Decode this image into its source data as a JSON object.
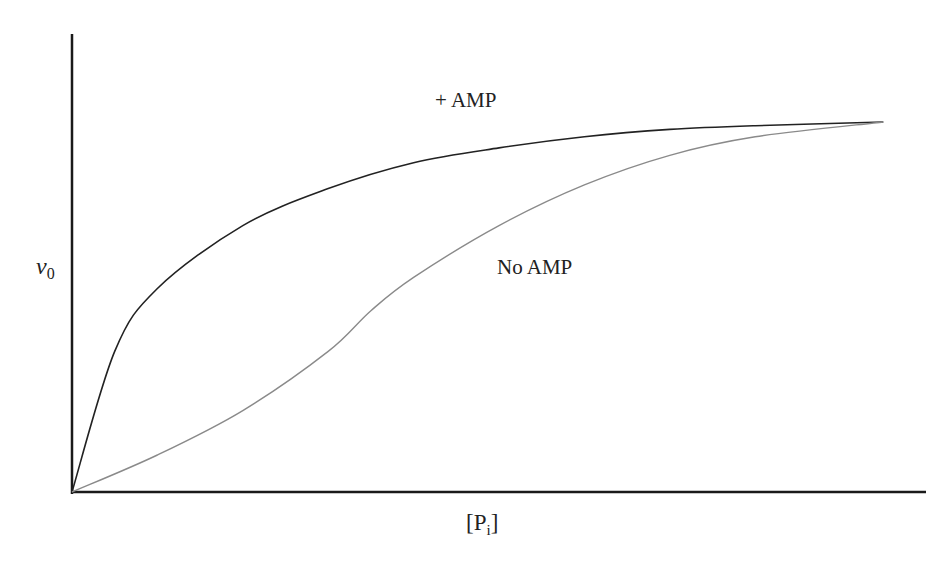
{
  "chart_data": {
    "type": "line",
    "title": "",
    "xlabel": "[Pi]",
    "xlabel_main": "P",
    "xlabel_sub": "i",
    "ylabel": "v0",
    "ylabel_main": "v",
    "ylabel_sub": "0",
    "xlim": [
      0,
      1
    ],
    "ylim": [
      0,
      1
    ],
    "ticks": "none",
    "grid": false,
    "legend": "inline curve labels",
    "series": [
      {
        "name": "+ AMP",
        "shape": "hyperbolic (Michaelis-Menten-like)",
        "color": "#222222",
        "x": [
          0,
          0.05,
          0.1,
          0.2,
          0.3,
          0.4,
          0.5,
          0.6,
          0.7,
          0.8,
          0.95
        ],
        "values": [
          0,
          0.38,
          0.55,
          0.72,
          0.82,
          0.89,
          0.93,
          0.96,
          0.98,
          0.99,
          1.0
        ]
      },
      {
        "name": "No AMP",
        "shape": "sigmoidal (cooperative)",
        "color": "#8a8a8a",
        "x": [
          0,
          0.1,
          0.2,
          0.3,
          0.35,
          0.4,
          0.5,
          0.6,
          0.7,
          0.8,
          0.95
        ],
        "values": [
          0,
          0.1,
          0.22,
          0.38,
          0.49,
          0.58,
          0.72,
          0.83,
          0.91,
          0.96,
          1.0
        ]
      }
    ]
  },
  "labels": {
    "amp": "+ AMP",
    "noamp": "No AMP"
  },
  "colors": {
    "axis": "#1a1a1a",
    "amp_curve": "#222222",
    "noamp_curve": "#8a8a8a",
    "background": "#ffffff"
  }
}
